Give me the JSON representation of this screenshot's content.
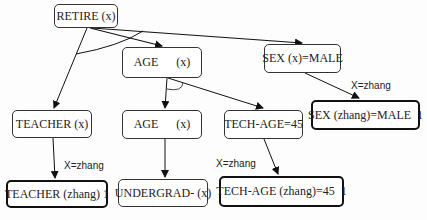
{
  "diagram": {
    "nodes": {
      "retire": "RETIRE (x)",
      "age_top": "AGE      (x)",
      "sex": "SEX (x)=MALE",
      "teacher": "TEACHER (x)",
      "age_mid": "AGE      (x)",
      "tech_age": "TECH-AGE=45",
      "sex_zhang": "SEX (zhang)=MALE  1",
      "teacher_zhang": "TEACHER (zhang) 1",
      "undergrad": "UNDERGRAD- (x)",
      "tech_age_zhang": "TECH-AGE (zhang)=45  1"
    },
    "edge_labels": {
      "sex_to_sex_zhang": "X=zhang",
      "teacher_to_teacher_zhang": "X=zhang",
      "tech_age_to_tech_age_zhang": "X=zhang"
    },
    "edges": [
      {
        "from": "retire",
        "to": "teacher"
      },
      {
        "from": "retire",
        "to": "age_top"
      },
      {
        "from": "retire",
        "to": "sex"
      },
      {
        "from": "age_top",
        "to": "age_mid"
      },
      {
        "from": "age_top",
        "to": "tech_age"
      },
      {
        "from": "sex",
        "to": "sex_zhang",
        "label": "X=zhang"
      },
      {
        "from": "teacher",
        "to": "teacher_zhang",
        "label": "X=zhang"
      },
      {
        "from": "age_mid",
        "to": "undergrad"
      },
      {
        "from": "tech_age",
        "to": "tech_age_zhang",
        "label": "X=zhang"
      }
    ],
    "colors": {
      "line": "#111111",
      "node_border": "#333333",
      "highlight_border": "#111111"
    }
  }
}
